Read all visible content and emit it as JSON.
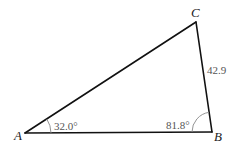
{
  "diagram": {
    "type": "triangle",
    "vertices": {
      "A": {
        "label": "A",
        "x": 25,
        "y": 133
      },
      "B": {
        "label": "B",
        "x": 212,
        "y": 132
      },
      "C": {
        "label": "C",
        "x": 196,
        "y": 22
      }
    },
    "angles": {
      "A": {
        "label": "32.0°"
      },
      "B": {
        "label": "81.8°"
      }
    },
    "sides": {
      "BC": {
        "label": "42.9"
      }
    },
    "colors": {
      "lines": "#111111",
      "arcs": "#888888",
      "measure_text": "#555555",
      "vertex_text": "#222222"
    }
  }
}
